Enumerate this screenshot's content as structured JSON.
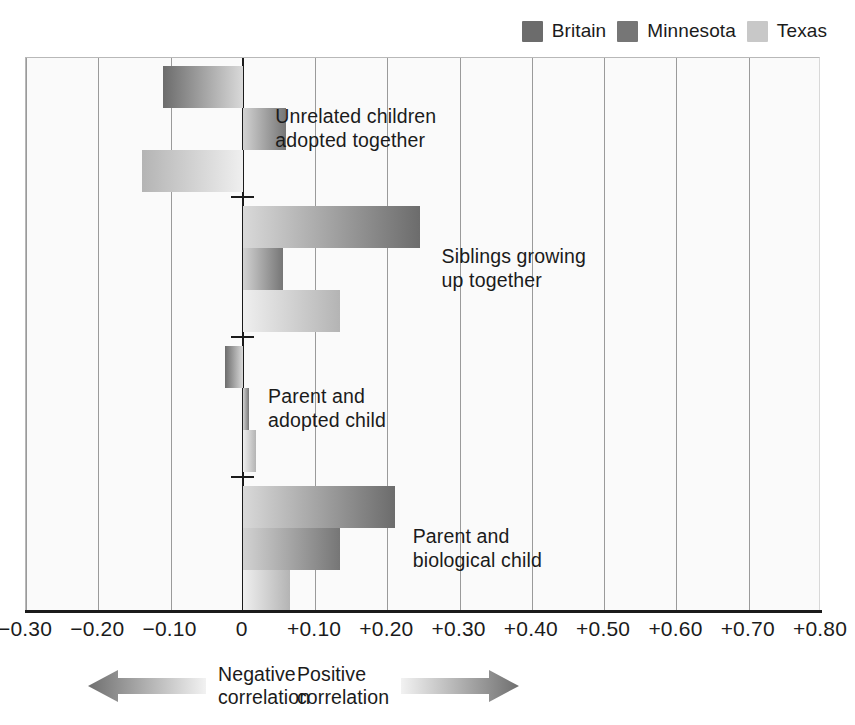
{
  "legend": {
    "items": [
      {
        "label": "Britain",
        "color": "#6c6c6c",
        "icon": "legend-swatch-icon"
      },
      {
        "label": "Minnesota",
        "color": "#767676",
        "icon": "legend-swatch-icon"
      },
      {
        "label": "Texas",
        "color": "#c8c8c8",
        "icon": "legend-swatch-icon"
      }
    ]
  },
  "footer": {
    "negative": {
      "line1": "Negative",
      "line2": "correlation",
      "icon": "arrow-left-icon"
    },
    "positive": {
      "line1": "Positive",
      "line2": "correlation",
      "icon": "arrow-right-icon"
    }
  },
  "chart_data": {
    "type": "bar",
    "orientation": "horizontal",
    "title": "",
    "xlabel": "",
    "ylabel": "",
    "xlim": [
      -0.3,
      0.8
    ],
    "grid": true,
    "legend_position": "top-right",
    "tick_labels": [
      "-0.30",
      "-0.20",
      "-0.10",
      "0",
      "+0.10",
      "+0.20",
      "+0.30",
      "+0.40",
      "+0.50",
      "+0.60",
      "+0.70",
      "+0.80"
    ],
    "tick_values": [
      -0.3,
      -0.2,
      -0.1,
      0,
      0.1,
      0.2,
      0.3,
      0.4,
      0.5,
      0.6,
      0.7,
      0.8
    ],
    "categories": [
      "Unrelated children\nadopted together",
      "Siblings growing\nup together",
      "Parent and\nadopted child",
      "Parent and\nbiological child"
    ],
    "series": [
      {
        "name": "Britain",
        "values": [
          -0.11,
          0.245,
          -0.025,
          0.21
        ]
      },
      {
        "name": "Minnesota",
        "values": [
          0.06,
          0.055,
          0.008,
          0.135
        ]
      },
      {
        "name": "Texas",
        "values": [
          -0.14,
          0.135,
          0.018,
          0.065
        ]
      }
    ]
  }
}
